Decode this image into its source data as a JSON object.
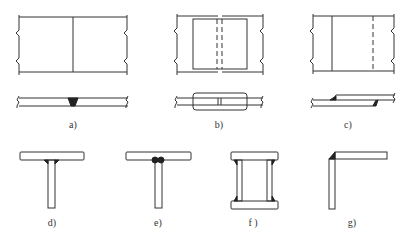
{
  "figure": {
    "panels": [
      {
        "id": "a",
        "label": "a)",
        "type": "butt-joint",
        "x": 73,
        "y": 122
      },
      {
        "id": "b",
        "label": "b)",
        "type": "butt-joint-with-cover-plates",
        "x": 219,
        "y": 122
      },
      {
        "id": "c",
        "label": "c)",
        "type": "lap-joint",
        "x": 348,
        "y": 122
      },
      {
        "id": "d",
        "label": "d)",
        "type": "t-joint-fillet",
        "x": 52,
        "y": 220
      },
      {
        "id": "e",
        "label": "e)",
        "type": "t-joint-double-fillet",
        "x": 158,
        "y": 220
      },
      {
        "id": "f",
        "label": "f )",
        "type": "box-joint",
        "x": 253,
        "y": 220
      },
      {
        "id": "g",
        "label": "g)",
        "type": "corner-joint",
        "x": 352,
        "y": 220
      }
    ],
    "colors": {
      "line": "#333333",
      "weld": "#222222",
      "background": "#ffffff"
    }
  }
}
